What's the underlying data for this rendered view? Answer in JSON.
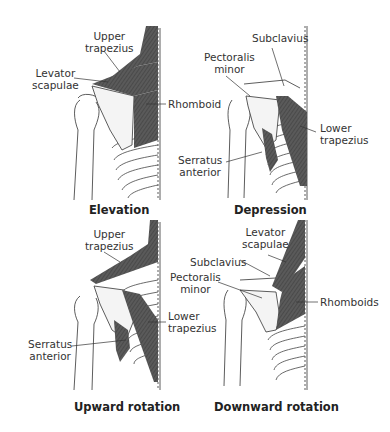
{
  "figure": {
    "panels": [
      {
        "id": "elevation",
        "title": "Elevation",
        "labels": [
          "Upper trapezius",
          "Levator scapulae",
          "Rhomboid"
        ]
      },
      {
        "id": "depression",
        "title": "Depression",
        "labels": [
          "Subclavius",
          "Pectoralis minor",
          "Lower trapezius",
          "Serratus anterior"
        ]
      },
      {
        "id": "upward-rotation",
        "title": "Upward rotation",
        "labels": [
          "Upper trapezius",
          "Lower trapezius",
          "Serratus anterior"
        ]
      },
      {
        "id": "downward-rotation",
        "title": "Downward rotation",
        "labels": [
          "Levator scapulae",
          "Subclavius",
          "Pectoralis minor",
          "Rhomboids"
        ]
      }
    ],
    "text": {
      "elev_upper_1": "Upper",
      "elev_upper_2": "trapezius",
      "elev_levator_1": "Levator",
      "elev_levator_2": "scapulae",
      "elev_rhomboid": "Rhomboid",
      "elev_title": "Elevation",
      "dep_subclavius": "Subclavius",
      "dep_pect_1": "Pectoralis",
      "dep_pect_2": "minor",
      "dep_lower_1": "Lower",
      "dep_lower_2": "trapezius",
      "dep_serratus_1": "Serratus",
      "dep_serratus_2": "anterior",
      "dep_title": "Depression",
      "up_upper_1": "Upper",
      "up_upper_2": "trapezius",
      "up_lower_1": "Lower",
      "up_lower_2": "trapezius",
      "up_serratus_1": "Serratus",
      "up_serratus_2": "anterior",
      "up_title": "Upward rotation",
      "down_levator_1": "Levator",
      "down_levator_2": "scapulae",
      "down_subclavius": "Subclavius",
      "down_pect_1": "Pectoralis",
      "down_pect_2": "minor",
      "down_rhomboids": "Rhomboids",
      "down_title": "Downward rotation"
    },
    "colors": {
      "muscle": "#555555",
      "line": "#333333",
      "background": "#ffffff"
    }
  }
}
